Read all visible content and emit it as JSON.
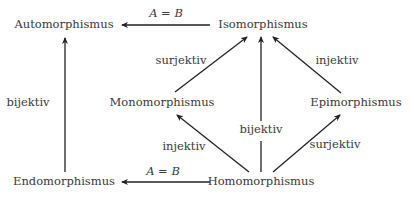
{
  "nodes": {
    "automorphismus": "Automorphismus",
    "isomorphismus": "Isomorphismus",
    "monomorphismus": "Monomorphismus",
    "epimorphismus": "Epimorphismus",
    "endomorphismus": "Endomorphismus",
    "homomorphismus": "Homomorphismus"
  },
  "edges": {
    "iso_to_auto": "A = B",
    "endo_to_auto": "bijektiv",
    "mono_to_iso": "surjektiv",
    "epi_to_iso": "injektiv",
    "homo_to_iso": "bijektiv",
    "homo_to_mono": "injektiv",
    "homo_to_epi": "surjektiv",
    "homo_to_endo": "A = B"
  },
  "colors": {
    "text": "#3a3a3a",
    "arrow": "#222222",
    "background": "#ffffff"
  }
}
